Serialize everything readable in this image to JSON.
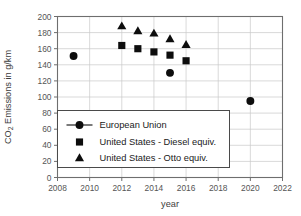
{
  "chart_data": {
    "type": "scatter",
    "title": "",
    "xlabel": "year",
    "ylabel": "CO2 Emissions in g/km",
    "ylabel_base": "CO",
    "ylabel_sub": "2",
    "ylabel_rest": " Emissions in g/km",
    "xlim": [
      2008,
      2022
    ],
    "ylim": [
      0,
      200
    ],
    "xticks": [
      2008,
      2010,
      2012,
      2014,
      2016,
      2018,
      2020,
      2022
    ],
    "xtick_labels": [
      "2008",
      "2010",
      "2012",
      "2014",
      "2016",
      "2018",
      "2020",
      "2022"
    ],
    "yticks": [
      0,
      20,
      40,
      60,
      80,
      100,
      120,
      140,
      160,
      180,
      200
    ],
    "ytick_labels": [
      "0",
      "20",
      "40",
      "60",
      "80",
      "100",
      "120",
      "140",
      "160",
      "180",
      "200"
    ],
    "grid": true,
    "legend_position": "lower-left-inside",
    "marker_color": "#0d0d0d",
    "series": [
      {
        "name": "European Union",
        "marker": "circle",
        "legend_has_line": true,
        "points": [
          {
            "x": 2009,
            "y": 151
          },
          {
            "x": 2015,
            "y": 130
          },
          {
            "x": 2020,
            "y": 95
          }
        ]
      },
      {
        "name": "United States - Diesel equiv.",
        "marker": "square",
        "legend_has_line": false,
        "points": [
          {
            "x": 2012,
            "y": 164
          },
          {
            "x": 2013,
            "y": 160
          },
          {
            "x": 2014,
            "y": 156
          },
          {
            "x": 2015,
            "y": 152
          },
          {
            "x": 2016,
            "y": 145
          }
        ]
      },
      {
        "name": "United States - Otto equiv.",
        "marker": "triangle",
        "legend_has_line": false,
        "points": [
          {
            "x": 2012,
            "y": 188
          },
          {
            "x": 2013,
            "y": 182
          },
          {
            "x": 2014,
            "y": 179
          },
          {
            "x": 2015,
            "y": 172
          },
          {
            "x": 2016,
            "y": 165
          }
        ]
      }
    ]
  },
  "legend": {
    "entries": [
      {
        "label": "European Union"
      },
      {
        "label": "United States - Diesel equiv."
      },
      {
        "label": "United States - Otto equiv."
      }
    ]
  }
}
